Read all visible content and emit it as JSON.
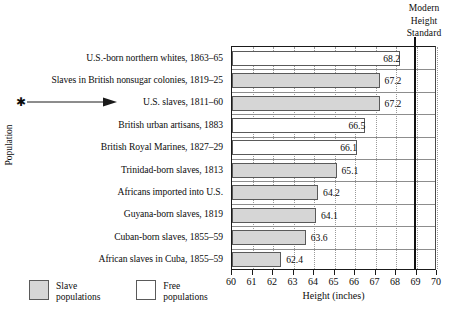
{
  "chart_data": {
    "type": "bar",
    "orientation": "horizontal",
    "title": "",
    "xlabel": "Height (inches)",
    "ylabel": "Population",
    "xlim": [
      60,
      70
    ],
    "xticks": [
      60,
      61,
      62,
      63,
      64,
      65,
      66,
      67,
      68,
      69,
      70
    ],
    "grid": "vertical dotted gridlines",
    "legend_position": "bottom-left",
    "categories": [
      "U.S.-born northern whites, 1863–65",
      "Slaves in British nonsugar colonies, 1819–25",
      "U.S. slaves, 1811–60",
      "British urban artisans, 1883",
      "British Royal Marines, 1827–29",
      "Trinidad-born slaves, 1813",
      "Africans imported into U.S.",
      "Guyana-born slaves, 1819",
      "Cuban-born slaves, 1855–59",
      "African slaves in Cuba, 1855–59"
    ],
    "values": [
      68.2,
      67.2,
      67.2,
      66.5,
      66.1,
      65.1,
      64.2,
      64.1,
      63.6,
      62.4
    ],
    "group": [
      "free",
      "slave",
      "slave",
      "free",
      "free",
      "slave",
      "slave",
      "slave",
      "slave",
      "slave"
    ],
    "value_label_placement": [
      "inside",
      "outside",
      "outside",
      "inside",
      "inside",
      "outside",
      "outside",
      "outside",
      "outside",
      "outside"
    ],
    "annotations": [
      {
        "target_category": "U.S. slaves, 1811–60",
        "marker": "✱",
        "style": "asterisk with arrow pointing right"
      },
      {
        "label": "Modern Height Standard",
        "value": 68.9,
        "style": "heavy vertical rule"
      }
    ],
    "series": [
      {
        "name": "Slave populations",
        "color": "#d6d6d6",
        "values": [
          null,
          67.2,
          67.2,
          null,
          null,
          65.1,
          64.2,
          64.1,
          63.6,
          62.4
        ]
      },
      {
        "name": "Free populations",
        "color": "#ffffff",
        "values": [
          68.2,
          null,
          null,
          66.5,
          66.1,
          null,
          null,
          null,
          null,
          null
        ]
      }
    ]
  },
  "axes": {
    "y_title": "Population",
    "x_title": "Height (inches)",
    "x_tick_labels": [
      "60",
      "61",
      "62",
      "63",
      "64",
      "65",
      "66",
      "67",
      "68",
      "69",
      "70"
    ]
  },
  "modern_standard": {
    "line1": "Modern",
    "line2": "Height",
    "line3": "Standard"
  },
  "legend": {
    "items": [
      {
        "swatch": "slave",
        "line1": "Slave",
        "line2": "populations"
      },
      {
        "swatch": "free",
        "line1": "Free",
        "line2": "populations"
      }
    ]
  },
  "annotation": {
    "asterisk": "✱"
  },
  "colors": {
    "slave_fill": "#d6d6d6",
    "free_fill": "#ffffff",
    "bar_stroke": "#5a5a5a",
    "axis": "#1a1a1a",
    "gridline": "#9a9a9a"
  }
}
